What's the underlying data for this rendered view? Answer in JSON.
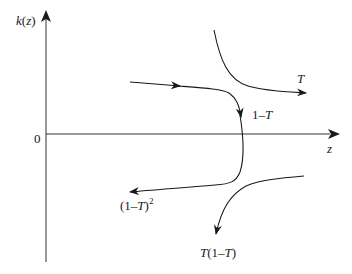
{
  "figure": {
    "type": "phase-diagram",
    "axes": {
      "y_label": "k(z)",
      "x_label": "z",
      "origin_label": "0"
    },
    "curves": [
      {
        "id": "T",
        "label": "T",
        "description": "hyperbola in upper-right descending from top, flowing right with arrow"
      },
      {
        "id": "one-minus-T",
        "label": "1–T",
        "description": "curve from left, arrow right, then bending down across z-axis"
      },
      {
        "id": "one-minus-T-squared",
        "label_base": "(1–T)",
        "label_exp": "2",
        "description": "continuation bending left with arrow pointing left"
      },
      {
        "id": "T-one-minus-T",
        "label": "T(1–T)",
        "description": "hyperbola in lower-right from right, curving down with arrow"
      }
    ],
    "colors": {
      "line": "#1a1a1a",
      "axis": "#333333",
      "background": "#ffffff"
    }
  }
}
